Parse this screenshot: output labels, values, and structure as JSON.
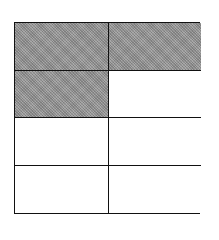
{
  "figure": {
    "type": "fraction-grid",
    "rows": 4,
    "columns": 2,
    "shaded_cells": [
      [
        0,
        0
      ],
      [
        0,
        1
      ],
      [
        1,
        0
      ]
    ],
    "shaded_count": 3,
    "total_cells": 8,
    "shade_color": "#9a9a9a",
    "line_color": "#111111"
  }
}
